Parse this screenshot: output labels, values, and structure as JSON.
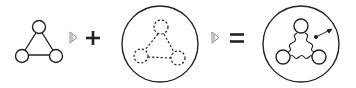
{
  "diagram": {
    "colors": {
      "stroke": "#222222",
      "arrow_stroke": "#888888",
      "background": "#ffffff"
    },
    "operators": [
      "plus",
      "equals"
    ],
    "terms": [
      {
        "id": "term-1",
        "kind": "solid-triangle-graph",
        "nodes": 3,
        "edges": 3,
        "enclosed": false
      },
      {
        "id": "term-2",
        "kind": "dashed-triangle-graph",
        "nodes": 3,
        "edges": 3,
        "enclosed": true
      },
      {
        "id": "term-3",
        "kind": "wavy-triangle-graph",
        "nodes": 3,
        "edges": 3,
        "enclosed": true,
        "annotation": "dot-with-arrow"
      }
    ]
  }
}
